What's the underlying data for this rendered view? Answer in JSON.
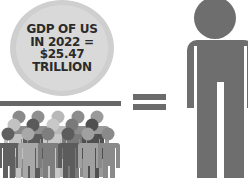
{
  "circle": {
    "lines": [
      "GDP OF US",
      "IN 2022 =",
      "$25.47",
      "TRILLION"
    ],
    "fill": "#d6d6d6"
  },
  "divider": {
    "color": "#676767"
  },
  "equals_sign": {
    "symbol": "=",
    "color": "#6b6b6b"
  },
  "crowd": {
    "label": "population-crowd",
    "colors": [
      "#5f5f5f",
      "#7a7a7a",
      "#9a9a9a",
      "#b5b5b5",
      "#4d4d4d"
    ]
  },
  "individual": {
    "label": "single-person",
    "color": "#6e6e6e"
  }
}
